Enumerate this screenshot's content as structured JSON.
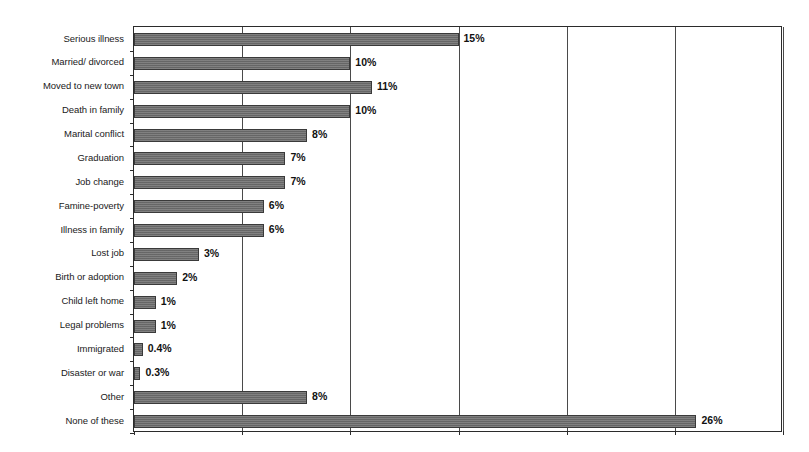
{
  "chart_data": {
    "type": "bar",
    "orientation": "horizontal",
    "title": "",
    "subtitle": "",
    "xlabel": "",
    "ylabel": "",
    "xlim": [
      0,
      30
    ],
    "ylim": null,
    "grid": true,
    "gridlines_at": [
      0,
      5,
      10,
      15,
      20,
      25,
      30
    ],
    "legend": null,
    "legend_position": "none",
    "value_label_suffix": "%",
    "bar_color": "#6e6e6e",
    "bar_border_color": "#3a3a3a",
    "axis_color": "#2b2b2b",
    "background_color": "#ffffff",
    "categories": [
      "Serious illness",
      "Married/ divorced",
      "Moved to new town",
      "Death in family",
      "Marital conflict",
      "Graduation",
      "Job change",
      "Famine-poverty",
      "Illness in family",
      "Lost job",
      "Birth or adoption",
      "Child left home",
      "Legal problems",
      "Immigrated",
      "Disaster or war",
      "Other",
      "None of these"
    ],
    "values": [
      15,
      10,
      11,
      10,
      8,
      7,
      7,
      6,
      6,
      3,
      2,
      1,
      1,
      0.4,
      0.3,
      8,
      26
    ],
    "value_labels": [
      "15%",
      "10%",
      "11%",
      "10%",
      "8%",
      "7%",
      "7%",
      "6%",
      "6%",
      "3%",
      "2%",
      "1%",
      "1%",
      "0.4%",
      "0.3%",
      "8%",
      "26%"
    ]
  }
}
